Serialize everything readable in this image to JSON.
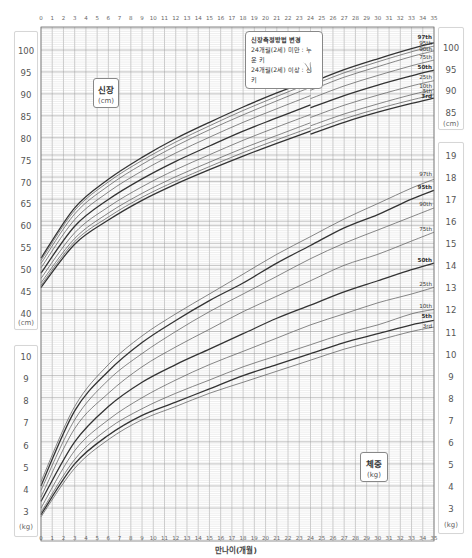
{
  "chart_data": [
    {
      "type": "line",
      "title": "신장",
      "unit": "(cm)",
      "xlabel": "만나이(개월)",
      "ylabel": "신장 (cm)",
      "x": [
        0,
        3,
        6,
        9,
        12,
        15,
        18,
        21,
        24,
        27,
        30,
        33,
        35
      ],
      "xlim": [
        0,
        35
      ],
      "ylim": [
        40,
        100
      ],
      "yticks": [
        40,
        45,
        50,
        55,
        60,
        65,
        70,
        75,
        80,
        85,
        90,
        95,
        100
      ],
      "grid": true,
      "series": [
        {
          "name": "97th",
          "bold": true,
          "values": [
            52.5,
            64.0,
            70.5,
            75.5,
            79.8,
            83.5,
            87.0,
            90.2,
            92.5,
            95.5,
            98.0,
            100.3,
            101.6
          ]
        },
        {
          "name": "95th",
          "bold": false,
          "values": [
            52.0,
            63.4,
            69.9,
            74.8,
            79.0,
            82.7,
            86.2,
            89.4,
            91.8,
            94.8,
            97.3,
            99.6,
            100.9
          ]
        },
        {
          "name": "90th",
          "bold": false,
          "values": [
            51.3,
            62.6,
            69.0,
            73.9,
            78.1,
            81.8,
            85.2,
            88.4,
            90.8,
            93.8,
            96.2,
            98.5,
            99.8
          ]
        },
        {
          "name": "75th",
          "bold": false,
          "values": [
            50.3,
            61.3,
            67.6,
            72.4,
            76.5,
            80.1,
            83.5,
            86.6,
            88.9,
            91.8,
            94.2,
            96.4,
            97.7
          ]
        },
        {
          "name": "50th",
          "bold": true,
          "values": [
            49.1,
            59.8,
            65.9,
            70.6,
            74.6,
            78.1,
            81.5,
            84.5,
            86.8,
            89.6,
            92.0,
            94.1,
            95.4
          ]
        },
        {
          "name": "25th",
          "bold": false,
          "values": [
            47.9,
            58.3,
            64.2,
            68.8,
            72.7,
            76.1,
            79.4,
            82.4,
            84.6,
            87.4,
            89.7,
            91.8,
            93.0
          ]
        },
        {
          "name": "10th",
          "bold": false,
          "values": [
            46.9,
            57.0,
            62.8,
            67.3,
            71.1,
            74.4,
            77.6,
            80.5,
            82.7,
            85.4,
            87.7,
            89.8,
            91.0
          ]
        },
        {
          "name": "5th",
          "bold": false,
          "values": [
            46.3,
            56.3,
            61.9,
            66.4,
            70.1,
            73.4,
            76.6,
            79.5,
            81.6,
            84.3,
            86.6,
            88.6,
            89.8
          ]
        },
        {
          "name": "3rd",
          "bold": true,
          "values": [
            45.8,
            55.7,
            61.2,
            65.7,
            69.4,
            72.7,
            75.8,
            78.7,
            80.8,
            83.5,
            85.8,
            87.8,
            89.0
          ]
        }
      ]
    },
    {
      "type": "line",
      "title": "체중",
      "unit": "(kg)",
      "xlabel": "만나이(개월)",
      "ylabel": "체중 (kg)",
      "x": [
        0,
        3,
        6,
        9,
        12,
        15,
        18,
        21,
        24,
        27,
        30,
        33,
        35
      ],
      "xlim": [
        0,
        35
      ],
      "ylim": [
        2.5,
        19.5
      ],
      "yticks_left": [
        3,
        4,
        5,
        6,
        7,
        8,
        9,
        10
      ],
      "yticks_right": [
        3,
        4,
        5,
        6,
        7,
        8,
        9,
        10,
        11,
        12,
        13,
        14,
        15,
        16,
        17,
        18,
        19
      ],
      "grid": true,
      "series": [
        {
          "name": "97th",
          "bold": false,
          "values": [
            4.2,
            7.6,
            9.5,
            10.8,
            11.8,
            12.7,
            13.6,
            14.5,
            15.3,
            16.1,
            16.8,
            17.5,
            17.9
          ]
        },
        {
          "name": "95th",
          "bold": true,
          "values": [
            4.0,
            7.4,
            9.2,
            10.5,
            11.5,
            12.4,
            13.2,
            14.1,
            14.9,
            15.7,
            16.3,
            17.0,
            17.4
          ]
        },
        {
          "name": "90th",
          "bold": false,
          "values": [
            3.8,
            7.0,
            8.8,
            10.0,
            11.0,
            11.9,
            12.7,
            13.5,
            14.3,
            15.0,
            15.6,
            16.2,
            16.6
          ]
        },
        {
          "name": "75th",
          "bold": false,
          "values": [
            3.5,
            6.6,
            8.2,
            9.4,
            10.3,
            11.1,
            11.9,
            12.6,
            13.3,
            14.0,
            14.5,
            15.1,
            15.5
          ]
        },
        {
          "name": "50th",
          "bold": true,
          "values": [
            3.3,
            6.0,
            7.6,
            8.7,
            9.5,
            10.2,
            10.9,
            11.6,
            12.2,
            12.8,
            13.3,
            13.8,
            14.1
          ]
        },
        {
          "name": "25th",
          "bold": false,
          "values": [
            3.0,
            5.6,
            7.0,
            8.0,
            8.8,
            9.5,
            10.1,
            10.7,
            11.3,
            11.8,
            12.3,
            12.7,
            13.0
          ]
        },
        {
          "name": "10th",
          "bold": false,
          "values": [
            2.8,
            5.2,
            6.6,
            7.5,
            8.2,
            8.8,
            9.4,
            9.9,
            10.4,
            10.9,
            11.3,
            11.8,
            12.0
          ]
        },
        {
          "name": "5th",
          "bold": true,
          "values": [
            2.7,
            5.0,
            6.3,
            7.2,
            7.8,
            8.4,
            9.0,
            9.5,
            10.0,
            10.5,
            10.9,
            11.3,
            11.5
          ]
        },
        {
          "name": "3rd",
          "bold": false,
          "values": [
            2.6,
            4.8,
            6.1,
            7.0,
            7.6,
            8.2,
            8.7,
            9.2,
            9.7,
            10.2,
            10.6,
            11.0,
            11.2
          ]
        }
      ]
    }
  ],
  "x_ticks": [
    "0",
    "1",
    "2",
    "3",
    "4",
    "5",
    "6",
    "7",
    "8",
    "9",
    "10",
    "11",
    "12",
    "13",
    "14",
    "15",
    "16",
    "17",
    "18",
    "19",
    "20",
    "21",
    "22",
    "23",
    "24",
    "25",
    "26",
    "27",
    "28",
    "29",
    "30",
    "31",
    "32",
    "33",
    "34",
    "35"
  ],
  "x_axis_label": "만나이(개월)",
  "height_panel": {
    "title": "신장",
    "unit": "(cm)",
    "left_ticks": [
      "100",
      "95",
      "90",
      "85",
      "80",
      "75",
      "70",
      "65",
      "60",
      "55",
      "50",
      "45",
      "40"
    ],
    "left_unit": "(cm)",
    "right_ticks": [
      "100",
      "95",
      "90",
      "85"
    ],
    "right_unit": "(cm)"
  },
  "weight_panel": {
    "title": "체중",
    "unit": "(kg)",
    "left_ticks": [
      "10",
      "9",
      "8",
      "7",
      "6",
      "5",
      "4",
      "3"
    ],
    "left_unit": "(kg)",
    "right_ticks": [
      "19",
      "18",
      "17",
      "16",
      "15",
      "14",
      "13",
      "12",
      "11",
      "10",
      "9",
      "8",
      "7",
      "6",
      "5",
      "4",
      "3"
    ],
    "right_unit": "(kg)"
  },
  "callout": {
    "title": "신장측정방법 변경",
    "line1": "24개월(2세) 미만 : 누운 키",
    "line2": "24개월(2세) 이상 : 선 키"
  },
  "colors": {
    "grid_major": "#9a9a9a",
    "grid_minor": "#cfcfcf",
    "curve": "#555555",
    "curve_bold": "#333333",
    "axis_box_border": "#d6d6d6"
  }
}
